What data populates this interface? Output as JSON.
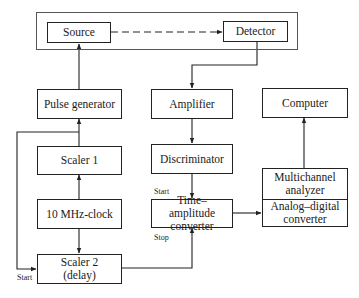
{
  "diagram": {
    "nodes": {
      "source": "Source",
      "detector": "Detector",
      "pulse_generator": "Pulse generator",
      "amplifier": "Amplifier",
      "computer": "Computer",
      "scaler1": "Scaler 1",
      "discriminator": "Discriminator",
      "multichannel_analyzer": "Multichannel analyzer",
      "clock": "10 MHz-clock",
      "tac": "Time–amplitude converter",
      "adc": "Analog–digital converter",
      "scaler2": "Scaler 2 (delay)"
    },
    "labels": {
      "tac_start": "Start",
      "tac_stop": "Stop",
      "scaler2_start": "Start"
    },
    "edges": [
      {
        "from": "pulse_generator",
        "to": "source",
        "style": "solid"
      },
      {
        "from": "source",
        "to": "detector",
        "style": "dashed"
      },
      {
        "from": "detector",
        "to": "amplifier",
        "style": "solid"
      },
      {
        "from": "amplifier",
        "to": "discriminator",
        "style": "solid"
      },
      {
        "from": "discriminator",
        "to": "tac",
        "label": "Start",
        "style": "solid"
      },
      {
        "from": "scaler1",
        "to": "pulse_generator",
        "style": "solid"
      },
      {
        "from": "clock",
        "to": "scaler1",
        "style": "solid"
      },
      {
        "from": "clock",
        "to": "scaler2",
        "style": "solid"
      },
      {
        "from": "pulse_generator",
        "to": "scaler2",
        "label": "Start",
        "style": "solid"
      },
      {
        "from": "scaler2",
        "to": "tac",
        "label": "Stop",
        "style": "solid"
      },
      {
        "from": "tac",
        "to": "adc",
        "style": "solid"
      },
      {
        "from": "multichannel_analyzer",
        "to": "computer",
        "style": "solid"
      }
    ]
  }
}
